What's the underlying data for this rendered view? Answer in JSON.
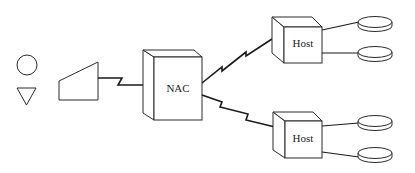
{
  "diagram": {
    "type": "network-topology",
    "nodes": {
      "circle_symbol": {
        "shape": "circle"
      },
      "triangle_symbol": {
        "shape": "inverted-triangle"
      },
      "terminal": {
        "shape": "trapezoid"
      },
      "nac": {
        "label": "NAC",
        "shape": "3d-box"
      },
      "host_top": {
        "label": "Host",
        "shape": "3d-box"
      },
      "host_bottom": {
        "label": "Host",
        "shape": "3d-box"
      },
      "disk_1": {
        "shape": "disk"
      },
      "disk_2": {
        "shape": "disk"
      },
      "disk_3": {
        "shape": "disk"
      },
      "disk_4": {
        "shape": "disk"
      }
    },
    "edges": [
      {
        "from": "terminal",
        "to": "nac",
        "style": "lightning"
      },
      {
        "from": "nac",
        "to": "host_top",
        "style": "lightning"
      },
      {
        "from": "nac",
        "to": "host_bottom",
        "style": "lightning"
      },
      {
        "from": "host_top",
        "to": "disk_1",
        "style": "line"
      },
      {
        "from": "host_top",
        "to": "disk_2",
        "style": "line"
      },
      {
        "from": "host_bottom",
        "to": "disk_3",
        "style": "line"
      },
      {
        "from": "host_bottom",
        "to": "disk_4",
        "style": "line"
      }
    ]
  }
}
